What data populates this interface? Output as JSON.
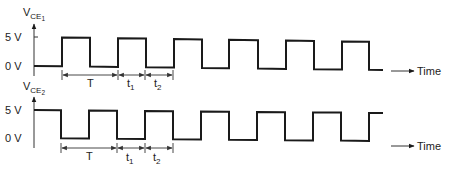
{
  "diagram": {
    "colors": {
      "line": "#1a1a1a",
      "text": "#222222",
      "background": "#ffffff"
    },
    "time_label": "Time",
    "levels": {
      "high": "5 V",
      "low": "0 V"
    },
    "signals": [
      {
        "name": "VCE1",
        "label_main": "V",
        "label_sub": "CE",
        "label_subsub": "1",
        "axis_x": 34,
        "axis_top": 23,
        "axis_bottom": 76,
        "level_5v_y": 37,
        "level_0v_y": 66,
        "high_y_left": 37,
        "high_y_right": 42,
        "low_y_left": 66,
        "low_y_right": 70,
        "start_state": "low",
        "start_x": 34,
        "end_x": 383,
        "edges_x": [
          62,
          90,
          118,
          146,
          174,
          202,
          229,
          258,
          286,
          314,
          342,
          369
        ],
        "time_arrow": {
          "x1": 391,
          "x2": 414,
          "y": 71
        },
        "dimensions": {
          "y": 75,
          "ticks_x": [
            62,
            118,
            145,
            173
          ],
          "labels": [
            {
              "text": "T",
              "sub": "",
              "x": 90,
              "y": 87
            },
            {
              "text": "t",
              "sub": "1",
              "x": 130,
              "y": 87
            },
            {
              "text": "t",
              "sub": "2",
              "x": 157,
              "y": 87
            }
          ]
        }
      },
      {
        "name": "VCE2",
        "label_main": "V",
        "label_sub": "CE",
        "label_subsub": "2",
        "axis_x": 34,
        "axis_top": 96,
        "axis_bottom": 148,
        "level_5v_y": 110,
        "level_0v_y": 138,
        "high_y_left": 110,
        "high_y_right": 113,
        "low_y_left": 138,
        "low_y_right": 141,
        "start_state": "high",
        "start_x": 34,
        "end_x": 383,
        "edges_x": [
          61,
          89,
          117,
          145,
          173,
          201,
          229,
          257,
          285,
          313,
          341,
          369
        ],
        "time_arrow": {
          "x1": 391,
          "x2": 414,
          "y": 146
        },
        "dimensions": {
          "y": 148,
          "ticks_x": [
            61,
            117,
            145,
            173
          ],
          "labels": [
            {
              "text": "T",
              "sub": "",
              "x": 89,
              "y": 160
            },
            {
              "text": "t",
              "sub": "1",
              "x": 129,
              "y": 161
            },
            {
              "text": "t",
              "sub": "2",
              "x": 156,
              "y": 161
            }
          ]
        }
      }
    ]
  }
}
